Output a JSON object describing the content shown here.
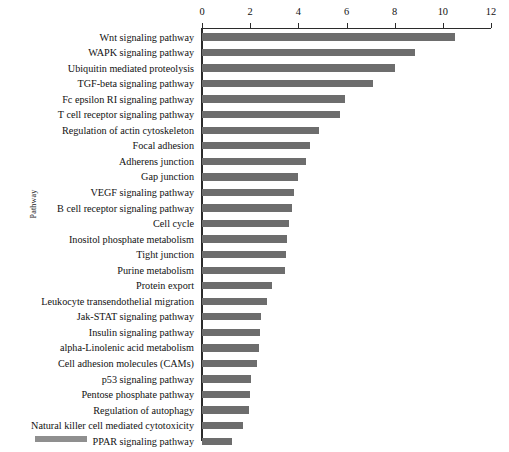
{
  "chart_data": {
    "type": "bar",
    "orientation": "horizontal",
    "title": "",
    "xlabel": "",
    "ylabel": "Pathway",
    "xlim": [
      0,
      12
    ],
    "ylim": null,
    "grid": false,
    "legend_position": "bottom-left",
    "legend_entries": [
      {
        "label": "",
        "color": "#8f8f8f"
      }
    ],
    "xticks": [
      0,
      2,
      4,
      6,
      8,
      10,
      12
    ],
    "xtick_labels": [
      "0",
      "2",
      "4",
      "6",
      "8",
      "10",
      "12"
    ],
    "series": [
      {
        "name": "",
        "color": "#6d6d6d",
        "values": [
          10.5,
          8.85,
          8.0,
          7.1,
          5.95,
          5.75,
          4.85,
          4.5,
          4.3,
          4.0,
          3.8,
          3.75,
          3.6,
          3.55,
          3.5,
          3.45,
          2.9,
          2.7,
          2.45,
          2.4,
          2.35,
          2.3,
          2.05,
          2.0,
          1.95,
          1.7,
          1.25
        ]
      }
    ],
    "categories": [
      "Wnt signaling pathway",
      "WAPK signaling pathway",
      "Ubiquitin mediated proteolysis",
      "TGF-beta signaling pathway",
      "Fc epsilon RI signaling pathway",
      "T cell receptor signaling pathway",
      "Regulation of actin cytoskeleton",
      "Focal adhesion",
      "Adherens junction",
      "Gap junction",
      "VEGF signaling pathway",
      "B cell receptor signaling pathway",
      "Cell cycle",
      "Inositol phosphate metabolism",
      "Tight junction",
      "Purine metabolism",
      "Protein export",
      "Leukocyte transendothelial migration",
      "Jak-STAT signaling pathway",
      "Insulin signaling pathway",
      "alpha-Linolenic acid metabolism",
      "Cell adhesion molecules (CAMs)",
      "p53 signaling pathway",
      "Pentose phosphate pathway",
      "Regulation of autophagy",
      "Natural killer cell mediated cytotoxicity",
      "PPAR signaling pathway"
    ]
  },
  "colors": {
    "bar": "#6d6d6d",
    "legend_swatch": "#8f8f8f",
    "axis": "#2b2b2b",
    "text": "#111111",
    "background": "#ffffff"
  }
}
